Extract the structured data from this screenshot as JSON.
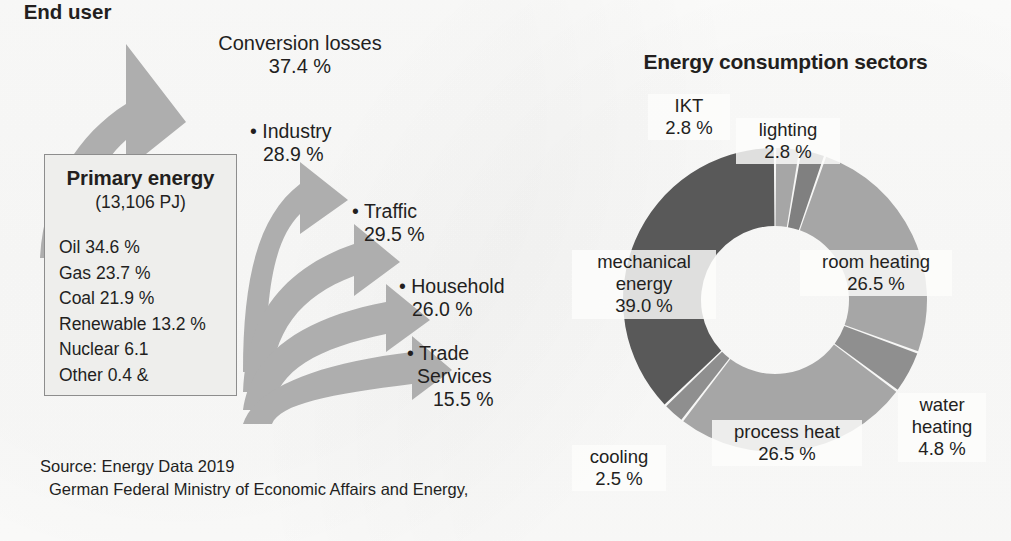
{
  "left_diagram": {
    "conversion_losses": {
      "name": "Conversion losses",
      "value": "37.4 %"
    },
    "primary_energy_box": {
      "title": "Primary energy",
      "subtitle": "(13,106 PJ)",
      "items": [
        "Oil 34.6 %",
        "Gas 23.7 %",
        "Coal 21.9 %",
        "Renewable 13.2 %",
        "Nuclear 6.1",
        "Other 0.4 &"
      ]
    },
    "end_user_heading": "End user",
    "end_users": [
      {
        "bullet": "• Industry",
        "value": "28.9 %"
      },
      {
        "bullet": "• Traffic",
        "value": "29.5 %"
      },
      {
        "bullet": "• Household",
        "value": "26.0 %"
      },
      {
        "bullet": "• Trade",
        "line2": "Services",
        "value": "15.5 %"
      }
    ],
    "source": {
      "line1": "Source: Energy Data 2019",
      "line2": "German Federal Ministry of Economic Affairs and Energy,"
    }
  },
  "chart_data": {
    "type": "pie",
    "title": "Energy consumption sectors",
    "xlabel": "",
    "ylabel": "",
    "donut": true,
    "legend": "none",
    "labels_position": "outside",
    "start_angle_deg": 0,
    "direction": "clockwise",
    "categories": [
      "IKT",
      "lighting",
      "room heating",
      "water heating",
      "process heat",
      "cooling",
      "mechanical energy"
    ],
    "values": [
      2.8,
      2.8,
      26.5,
      4.8,
      26.5,
      2.5,
      39.0
    ],
    "value_labels": [
      "2.8 %",
      "2.8 %",
      "26.5 %",
      "4.8 %",
      "26.5 %",
      "2.5 %",
      "39.0 %"
    ],
    "colors": [
      "#a6a6a6",
      "#808080",
      "#a6a6a6",
      "#8f8f8f",
      "#a6a6a6",
      "#8f8f8f",
      "#595959"
    ],
    "slices": [
      {
        "label": "IKT",
        "value": "2.8 %",
        "color": "#a6a6a6"
      },
      {
        "label": "lighting",
        "value": "2.8 %",
        "color": "#808080"
      },
      {
        "label": "room heating",
        "value": "26.5 %",
        "color": "#a6a6a6"
      },
      {
        "label": "water heating",
        "value": "4.8 %",
        "color": "#8f8f8f"
      },
      {
        "label": "process heat",
        "value": "26.5 %",
        "color": "#a6a6a6"
      },
      {
        "label": "cooling",
        "value": "2.5 %",
        "color": "#8f8f8f"
      },
      {
        "label": "mechanical energy",
        "value": "39.0 %",
        "color": "#595959"
      }
    ]
  },
  "palette": {
    "arrow_gray": "#aeaeae",
    "box_fill": "#eeeeec",
    "box_border": "#8d8d8d",
    "text": "#231f1e",
    "page_bg": "#fdfdfc"
  }
}
